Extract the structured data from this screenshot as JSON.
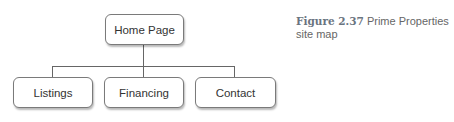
{
  "diagram": {
    "root": {
      "label": "Home Page"
    },
    "children": [
      {
        "label": "Listings"
      },
      {
        "label": "Financing"
      },
      {
        "label": "Contact"
      }
    ]
  },
  "caption": {
    "figure_number": "Figure 2.37",
    "text": "Prime Properties site map"
  },
  "colors": {
    "line": "#666666",
    "border": "#7a7a7a",
    "text": "#333333",
    "caption_label": "#6a7480",
    "caption_text": "#666666"
  }
}
